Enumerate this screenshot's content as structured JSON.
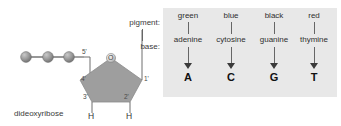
{
  "diagram": {
    "molecule": {
      "sugar_label": "dideoxyribose",
      "ring_oxygen": "O",
      "carbon_positions": [
        "1'",
        "2'",
        "3'",
        "4'",
        "5'"
      ],
      "hydrogens": [
        "H",
        "H"
      ],
      "phosphate_count": 3
    },
    "row_labels": {
      "pigment": "pigment:",
      "base": "base:"
    },
    "columns": [
      {
        "pigment": "green",
        "base": "adenine",
        "letter": "A"
      },
      {
        "pigment": "blue",
        "base": "cytosine",
        "letter": "C"
      },
      {
        "pigment": "black",
        "base": "guanine",
        "letter": "G"
      },
      {
        "pigment": "red",
        "base": "thymine",
        "letter": "T"
      }
    ],
    "colors": {
      "panel_background": "#e8e8e8",
      "ring_fill": "#9a9a9a",
      "sphere_fill": "#8e8e8e",
      "line": "#666666",
      "text": "#2b2b2b"
    }
  }
}
